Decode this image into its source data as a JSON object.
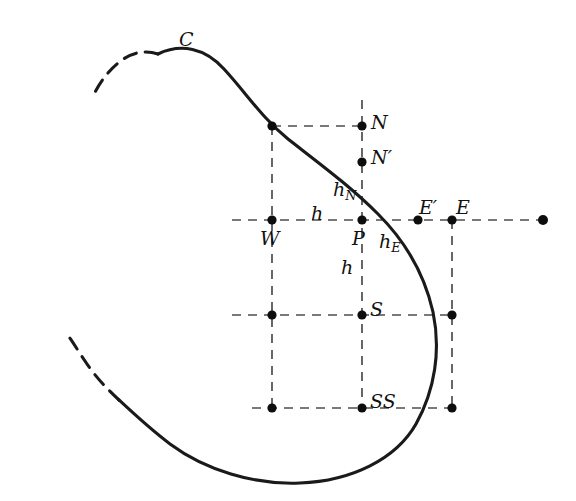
{
  "figure": {
    "colors": {
      "curve": "#1a1a1a",
      "grid": "#4d4d4d",
      "node": "#0d0d0d",
      "background": "#ffffff",
      "label": "#111111"
    },
    "labels": [
      {
        "id": "C",
        "text": "C",
        "x": 179,
        "y": 30,
        "kind": "main",
        "anchor": "curve-boundary-label"
      },
      {
        "id": "N",
        "text": "N",
        "x": 371,
        "y": 113,
        "kind": "main",
        "anchor": "node-north"
      },
      {
        "id": "Np",
        "text": "N′",
        "x": 371,
        "y": 148,
        "kind": "main",
        "anchor": "node-north-prime"
      },
      {
        "id": "hN",
        "text": "h",
        "sub": "N",
        "x": 333,
        "y": 180,
        "kind": "sub",
        "anchor": "spacing-h-north"
      },
      {
        "id": "h1",
        "text": "h",
        "x": 311,
        "y": 204,
        "kind": "main",
        "anchor": "spacing-h-west"
      },
      {
        "id": "W",
        "text": "W",
        "x": 260,
        "y": 229,
        "kind": "main",
        "anchor": "node-west"
      },
      {
        "id": "P",
        "text": "P",
        "x": 352,
        "y": 229,
        "kind": "main",
        "anchor": "node-center"
      },
      {
        "id": "hE",
        "text": "h",
        "sub": "E",
        "x": 379,
        "y": 232,
        "kind": "sub",
        "anchor": "spacing-h-east"
      },
      {
        "id": "Ep",
        "text": "E′",
        "x": 419,
        "y": 198,
        "kind": "main",
        "anchor": "node-east-prime"
      },
      {
        "id": "E",
        "text": "E",
        "x": 456,
        "y": 198,
        "kind": "main",
        "anchor": "node-east"
      },
      {
        "id": "h2",
        "text": "h",
        "x": 341,
        "y": 258,
        "kind": "main",
        "anchor": "spacing-h-south"
      },
      {
        "id": "S",
        "text": "S",
        "x": 370,
        "y": 300,
        "kind": "main",
        "anchor": "node-south"
      },
      {
        "id": "SS",
        "text": "SS",
        "x": 370,
        "y": 392,
        "kind": "main",
        "anchor": "node-south-south"
      }
    ],
    "grid": {
      "columns": [
        {
          "name": "W",
          "x": 272
        },
        {
          "name": "P",
          "x": 362
        },
        {
          "name": "E",
          "x": 452
        }
      ],
      "rows": [
        {
          "name": "N",
          "y": 126
        },
        {
          "name": "P",
          "y": 220
        },
        {
          "name": "S",
          "y": 315
        },
        {
          "name": "SS",
          "y": 408
        }
      ],
      "spacing_h": 90,
      "dash_pattern": "9 7"
    },
    "nodes": [
      {
        "name": "grid-node-nw",
        "x": 272,
        "y": 126,
        "r": 4.6
      },
      {
        "name": "node-north",
        "x": 362,
        "y": 126,
        "r": 4.6
      },
      {
        "name": "node-north-prime",
        "x": 362,
        "y": 162,
        "r": 4.6
      },
      {
        "name": "node-west",
        "x": 272,
        "y": 220,
        "r": 4.6
      },
      {
        "name": "node-center-p",
        "x": 362,
        "y": 220,
        "r": 4.6
      },
      {
        "name": "node-east-prime",
        "x": 418,
        "y": 220,
        "r": 4.6
      },
      {
        "name": "node-east",
        "x": 452,
        "y": 220,
        "r": 4.6
      },
      {
        "name": "node-far-east",
        "x": 543,
        "y": 220,
        "r": 5.0
      },
      {
        "name": "grid-node-sw",
        "x": 272,
        "y": 315,
        "r": 4.6
      },
      {
        "name": "node-south",
        "x": 362,
        "y": 315,
        "r": 4.6
      },
      {
        "name": "grid-node-se",
        "x": 452,
        "y": 315,
        "r": 4.6
      },
      {
        "name": "grid-node-ssw",
        "x": 272,
        "y": 408,
        "r": 4.6
      },
      {
        "name": "node-south-south",
        "x": 362,
        "y": 408,
        "r": 4.6
      },
      {
        "name": "grid-node-sse",
        "x": 452,
        "y": 408,
        "r": 4.6
      }
    ],
    "gridlines": {
      "horizontal": [
        {
          "name": "gridline-row-n",
          "x1": 272,
          "x2": 362,
          "y": 126
        },
        {
          "name": "gridline-row-p",
          "x1": 232,
          "x2": 543,
          "y": 220
        },
        {
          "name": "gridline-row-s",
          "x1": 232,
          "x2": 452,
          "y": 315
        },
        {
          "name": "gridline-row-ss",
          "x1": 252,
          "x2": 452,
          "y": 408
        }
      ],
      "vertical": [
        {
          "name": "gridline-col-w",
          "y1": 126,
          "y2": 408,
          "x": 272
        },
        {
          "name": "gridline-col-p",
          "y1": 100,
          "y2": 408,
          "x": 362
        },
        {
          "name": "gridline-col-e",
          "y1": 220,
          "y2": 408,
          "x": 452
        }
      ]
    },
    "curve": {
      "name": "boundary-curve-C",
      "solid_path": "M 158 54 C 181 43 205 48 224 69 C 247 94 262 118 288 139 C 320 164 350 186 378 214 C 404 240 424 272 433 312 C 441 350 435 390 416 424 C 396 459 352 481 300 483 C 254 485 205 470 170 444 C 150 429 134 414 119 400",
      "dash_top_path": "M 158 54 C 146 50 133 52 122 60 C 108 70 99 84 93 96",
      "dash_bottom_path": "M 119 400 C 106 388 94 375 85 361 C 77 349 72 341 69 337",
      "stroke_width": 3.1,
      "dash_pattern": "13 9"
    }
  }
}
